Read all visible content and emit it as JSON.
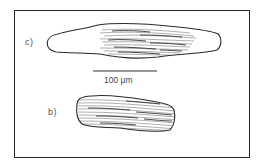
{
  "figure": {
    "panels": [
      {
        "id": "c",
        "label": "c)",
        "description": "elongated cell outline, right-center portion hatched with striations"
      },
      {
        "id": "b",
        "label": "b)",
        "description": "shorter rounded cell fully hatched with striations"
      }
    ],
    "scale_bar": {
      "label": "100 μm",
      "value": 100,
      "unit": "μm"
    },
    "colors": {
      "outline": "#2a2a2a",
      "hatch_dark": "#333333",
      "hatch_light": "#9a9a9a",
      "background": "#ffffff"
    }
  }
}
